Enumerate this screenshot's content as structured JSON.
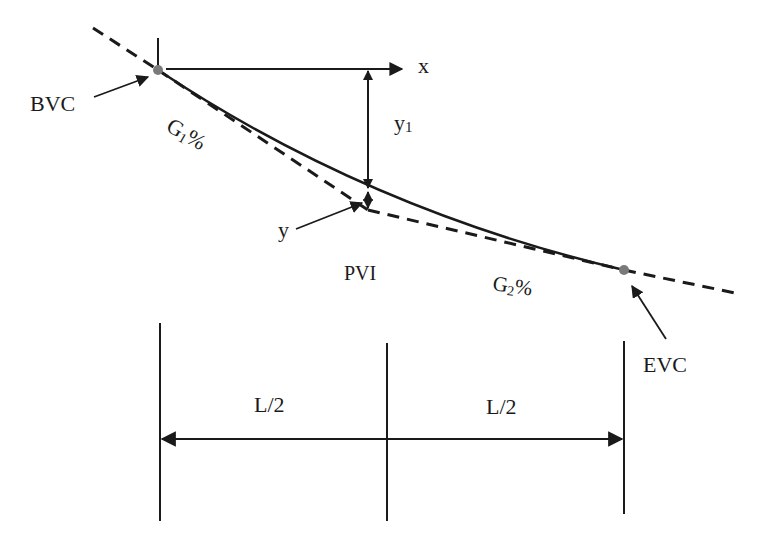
{
  "diagram": {
    "type": "vertical-curve",
    "labels": {
      "bvc": "BVC",
      "evc": "EVC",
      "pvi": "PVI",
      "x": "x",
      "y": "y",
      "y1_main": "y",
      "y1_sub": "1",
      "g1_main": "G",
      "g1_sub": "1",
      "g1_pct": "%",
      "g2_main": "G",
      "g2_sub": "2",
      "g2_pct": "%",
      "half_left": "L/2",
      "half_right": "L/2"
    },
    "colors": {
      "line": "#1a1a1a",
      "point": "#7a7a7a",
      "background": "#ffffff"
    },
    "points": {
      "bvc": [
        158,
        70
      ],
      "pvi": [
        368,
        210
      ],
      "evc": [
        624,
        270
      ]
    }
  }
}
